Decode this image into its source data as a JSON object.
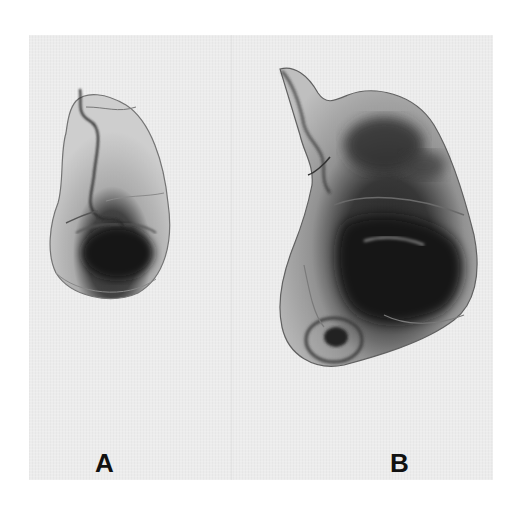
{
  "figure": {
    "panels": [
      {
        "id": "A",
        "label": "A",
        "description": "smaller specimen with dark lower region"
      },
      {
        "id": "B",
        "label": "B",
        "description": "larger specimen with extensive dark central region"
      }
    ],
    "colors": {
      "background": "#ffffff",
      "plate": "#ececec",
      "tissue_light": "#cfcfcf",
      "tissue_mid": "#8a8a8a",
      "tissue_dark": "#1a1a1a",
      "label": "#111111"
    }
  }
}
